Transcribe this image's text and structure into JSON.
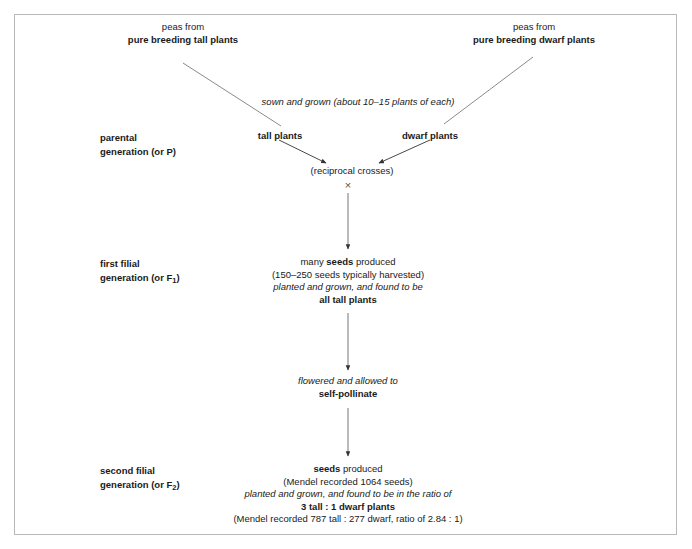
{
  "diagram": {
    "frame_color": "#b8b8b8",
    "background": "#ffffff",
    "text_color": "#1a1a1a",
    "parents": {
      "left": {
        "line1": "peas from",
        "line2": "pure breeding tall plants"
      },
      "right": {
        "line1": "peas from",
        "line2": "pure breeding dwarf plants"
      }
    },
    "sowing_note": "sown and grown (about 10–15 plants of each)",
    "generations": [
      {
        "id": "parental",
        "label_line1": "parental",
        "label_line2_prefix": "generation (or P",
        "label_line2_suffix": ")",
        "label_subscript": ""
      },
      {
        "id": "f1",
        "label_line1": "first filial",
        "label_line2_prefix": "generation (or F",
        "label_line2_suffix": ")",
        "label_subscript": "1"
      },
      {
        "id": "f2",
        "label_line1": "second filial",
        "label_line2_prefix": "generation (or F",
        "label_line2_suffix": ")",
        "label_subscript": "2"
      }
    ],
    "parental_row": {
      "left_plants": "tall plants",
      "right_plants": "dwarf plants",
      "cross_note": "(reciprocal crosses)",
      "cross_symbol": "×"
    },
    "f1_block": {
      "line1_pre": "many ",
      "line1_bold": "seeds",
      "line1_post": " produced",
      "line2": "(150–250 seeds typically harvested)",
      "line3_italic": "planted and grown, and found to be",
      "line4_bold": "all tall plants"
    },
    "selfpollinate_block": {
      "line1_italic": "flowered and allowed to",
      "line2_bold": "self-pollinate"
    },
    "f2_block": {
      "line1_bold": "seeds",
      "line1_post": " produced",
      "line2": "(Mendel recorded 1064 seeds)",
      "line3_italic": "planted and grown, and found to be in the ratio of",
      "line4_bold": "3 tall : 1 dwarf plants",
      "line5": "(Mendel recorded 787 tall : 277 dwarf, ratio of 2.84 : 1)"
    }
  }
}
